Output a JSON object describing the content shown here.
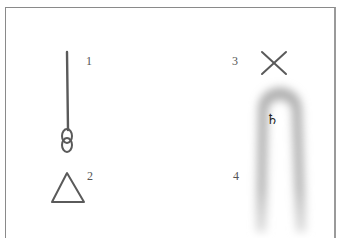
{
  "diagram": {
    "items": [
      {
        "id": 1,
        "label": "1",
        "shape": "line-with-chain-knot"
      },
      {
        "id": 2,
        "label": "2",
        "shape": "triangle"
      },
      {
        "id": 3,
        "label": "3",
        "shape": "x-cross"
      },
      {
        "id": 4,
        "label": "4",
        "shape": "blurred-elongated-arch"
      }
    ],
    "symbol": "♄",
    "colors": {
      "stroke": "#5a5a5a",
      "frame": "#8a8a8a",
      "blur": "#9a9a9a"
    }
  }
}
